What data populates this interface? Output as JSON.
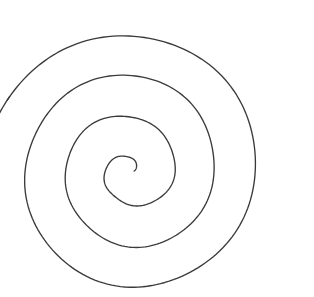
{
  "figure": {
    "kind": "line-drawing",
    "background_color": "#ffffff",
    "stroke_color": "#3a3a3a",
    "stroke_width": 1.35,
    "canvas": {
      "width": 314,
      "height": 297
    }
  },
  "chart_data": {
    "type": "line",
    "subtitle": "",
    "xlabel": "",
    "ylabel": "",
    "xlim": [
      0,
      314
    ],
    "ylim": [
      0,
      297
    ],
    "grid": false,
    "legend_position": "none",
    "annotations": [],
    "tick_labels": {
      "x": [],
      "y": []
    },
    "spiral": {
      "equation": "r = a + b * theta",
      "center": {
        "x": 130,
        "y": 171
      },
      "a": 4,
      "b": 6.45,
      "turns": 3.55,
      "theta_start_deg": 0,
      "theta_end_deg": 1278,
      "direction": "counterclockwise-outward",
      "start_point": {
        "x": 134,
        "y": 171
      },
      "end_point": {
        "x": 272,
        "y": 253
      },
      "extents": {
        "left": 20,
        "right": 284,
        "top": 22,
        "bottom": 280
      },
      "ring_crossings": {
        "horizontal_left_of_center": [
          20,
          52,
          85,
          118
        ],
        "horizontal_right_of_center": [
          155,
          195,
          240,
          284
        ],
        "vertical_above_center": [
          23,
          62,
          103,
          150
        ],
        "vertical_below_center": [
          185,
          222,
          258,
          280
        ]
      },
      "tail_fade": {
        "from": {
          "x": 262,
          "y": 238
        },
        "to": {
          "x": 272,
          "y": 253
        }
      }
    },
    "series": [
      {
        "name": "spiral",
        "points_polar_deg": [
          {
            "theta": 0,
            "r": 4
          },
          {
            "theta": 90,
            "r": 14
          },
          {
            "theta": 180,
            "r": 24
          },
          {
            "theta": 270,
            "r": 34
          },
          {
            "theta": 360,
            "r": 44
          },
          {
            "theta": 450,
            "r": 55
          },
          {
            "theta": 540,
            "r": 65
          },
          {
            "theta": 630,
            "r": 75
          },
          {
            "theta": 720,
            "r": 85
          },
          {
            "theta": 810,
            "r": 95
          },
          {
            "theta": 900,
            "r": 105
          },
          {
            "theta": 990,
            "r": 116
          },
          {
            "theta": 1080,
            "r": 126
          },
          {
            "theta": 1170,
            "r": 136
          },
          {
            "theta": 1278,
            "r": 148
          }
        ]
      }
    ]
  }
}
